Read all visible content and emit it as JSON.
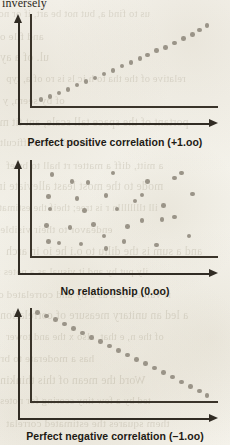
{
  "page": {
    "background_color": "#f5f3ec",
    "ink_color": "#1d1a14",
    "axis_color": "#312c24",
    "dot_color": "#9a9488",
    "top_partial_word": "inversely"
  },
  "bleed_through_text": [
    "us to find a, but not be art, if or none",
    "and file on",
    "ul. of a ay",
    "relative of the tha to h ic ls is ro of a, typ",
    "of by seem, y on",
    "portant of the space tall scale, ant tit ma",
    "and drs the difficult",
    "a mitt, diff a matter rt hall to brief",
    "mode to the most least alleviate in a",
    "ill tlllllllln r is tree; theif the estimate",
    "endeavor to their visible",
    "and a sum is the dillu to o.i  he io in arch",
    "ily put hy and it visual as a notes for",
    "rt values of a as a by and correlated of",
    "a led an unitary measure of correlation",
    "of the n, e that, also x the and tower",
    "has a moderate to brief",
    "Word the mean of this thinking",
    "ted by a few tiny scoring for notes",
    "them squares the estimated correlat"
  ],
  "charts": [
    {
      "id": "positive",
      "caption": "Perfect positive correlation (+1.oo)",
      "chart_data": {
        "type": "scatter",
        "title": "Perfect positive correlation (+1.oo)",
        "correlation": 1.0,
        "xlabel": "",
        "ylabel": "",
        "grid": false,
        "legend": false,
        "points": [
          [
            0.04,
            0.05
          ],
          [
            0.09,
            0.09
          ],
          [
            0.14,
            0.13
          ],
          [
            0.19,
            0.17
          ],
          [
            0.24,
            0.22
          ],
          [
            0.29,
            0.26
          ],
          [
            0.34,
            0.3
          ],
          [
            0.39,
            0.35
          ],
          [
            0.44,
            0.39
          ],
          [
            0.49,
            0.44
          ],
          [
            0.54,
            0.48
          ],
          [
            0.59,
            0.53
          ],
          [
            0.63,
            0.57
          ],
          [
            0.68,
            0.62
          ],
          [
            0.73,
            0.66
          ],
          [
            0.78,
            0.71
          ],
          [
            0.83,
            0.76
          ],
          [
            0.88,
            0.81
          ],
          [
            0.92,
            0.86
          ],
          [
            0.96,
            0.91
          ]
        ]
      }
    },
    {
      "id": "none",
      "caption": "No relationship (0.oo)",
      "chart_data": {
        "type": "scatter",
        "title": "No relationship (0.oo)",
        "correlation": 0.0,
        "xlabel": "",
        "ylabel": "",
        "grid": false,
        "legend": false,
        "points": [
          [
            0.1,
            0.88
          ],
          [
            0.21,
            0.8
          ],
          [
            0.3,
            0.79
          ],
          [
            0.44,
            0.9
          ],
          [
            0.63,
            0.8
          ],
          [
            0.78,
            0.84
          ],
          [
            0.82,
            0.9
          ],
          [
            0.08,
            0.63
          ],
          [
            0.24,
            0.61
          ],
          [
            0.4,
            0.64
          ],
          [
            0.56,
            0.58
          ],
          [
            0.6,
            0.65
          ],
          [
            0.88,
            0.66
          ],
          [
            0.09,
            0.49
          ],
          [
            0.28,
            0.47
          ],
          [
            0.46,
            0.49
          ],
          [
            0.72,
            0.53
          ],
          [
            0.78,
            0.4
          ],
          [
            0.07,
            0.3
          ],
          [
            0.2,
            0.28
          ],
          [
            0.33,
            0.31
          ],
          [
            0.52,
            0.29
          ],
          [
            0.6,
            0.36
          ],
          [
            0.71,
            0.37
          ],
          [
            0.08,
            0.12
          ],
          [
            0.14,
            0.1
          ],
          [
            0.26,
            0.09
          ],
          [
            0.39,
            0.18
          ],
          [
            0.4,
            0.04
          ],
          [
            0.5,
            0.12
          ],
          [
            0.68,
            0.08
          ],
          [
            0.86,
            0.18
          ]
        ]
      }
    },
    {
      "id": "negative",
      "caption": "Perfect negative correlation (–1.oo)",
      "chart_data": {
        "type": "scatter",
        "title": "Perfect negative correlation (-1.oo)",
        "correlation": -1.0,
        "xlabel": "",
        "ylabel": "",
        "grid": false,
        "legend": false,
        "points": [
          [
            0.02,
            0.97
          ],
          [
            0.07,
            0.93
          ],
          [
            0.12,
            0.89
          ],
          [
            0.17,
            0.84
          ],
          [
            0.22,
            0.79
          ],
          [
            0.27,
            0.74
          ],
          [
            0.32,
            0.69
          ],
          [
            0.37,
            0.64
          ],
          [
            0.42,
            0.59
          ],
          [
            0.47,
            0.54
          ],
          [
            0.52,
            0.49
          ],
          [
            0.57,
            0.44
          ],
          [
            0.62,
            0.39
          ],
          [
            0.67,
            0.34
          ],
          [
            0.72,
            0.29
          ],
          [
            0.77,
            0.24
          ],
          [
            0.82,
            0.18
          ],
          [
            0.87,
            0.13
          ],
          [
            0.92,
            0.08
          ],
          [
            0.96,
            0.03
          ]
        ]
      }
    }
  ]
}
